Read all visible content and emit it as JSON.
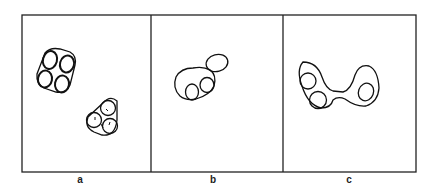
{
  "figure": {
    "panels": [
      {
        "id": "a",
        "label": "a",
        "description": "Two clusters: a rounded-square envelope enclosing four circles (top-left) and a rounded-triangle envelope enclosing three circles with small marks (lower-right)"
      },
      {
        "id": "b",
        "label": "b",
        "description": "Large closed loop containing two small circles, with a smaller lobe attached at upper right"
      },
      {
        "id": "c",
        "label": "c",
        "description": "Dumbbell-shaped envelope: left lobe enclosing two circles, right lobe enclosing one oval, joined by a narrow bridge"
      }
    ]
  }
}
